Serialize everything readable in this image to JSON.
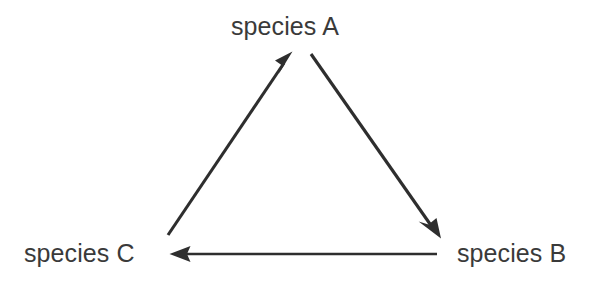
{
  "diagram": {
    "type": "directed-cycle-graph",
    "background_color": "#ffffff",
    "line_color": "#2e2e2e",
    "text_color": "#3a3a3a",
    "nodes": [
      {
        "id": "A",
        "label": "species A",
        "position": "top-center"
      },
      {
        "id": "B",
        "label": "species B",
        "position": "bottom-right"
      },
      {
        "id": "C",
        "label": "species C",
        "position": "bottom-left"
      }
    ],
    "edges": [
      {
        "id": "c-to-a",
        "from": "C",
        "to": "A",
        "direction": "up-right",
        "arrowhead": "end"
      },
      {
        "id": "a-to-b",
        "from": "A",
        "to": "B",
        "direction": "down-right",
        "arrowhead": "end"
      },
      {
        "id": "b-to-c",
        "from": "B",
        "to": "C",
        "direction": "left",
        "arrowhead": "end"
      }
    ]
  }
}
